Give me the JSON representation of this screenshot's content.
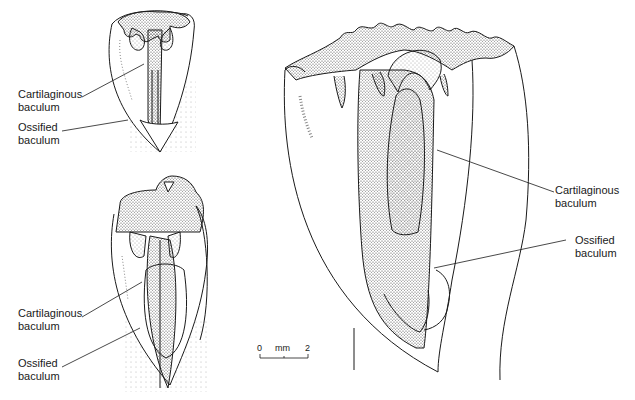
{
  "figure": {
    "panels": [
      {
        "id": "top-left",
        "labels": [
          {
            "line1": "Cartilaginous",
            "line2": "baculum"
          },
          {
            "line1": "Ossified",
            "line2": "baculum"
          }
        ]
      },
      {
        "id": "bottom-left",
        "labels": [
          {
            "line1": "Cartilaginous",
            "line2": "baculum"
          },
          {
            "line1": "Ossified",
            "line2": "baculum"
          }
        ]
      },
      {
        "id": "right",
        "labels": [
          {
            "line1": "Cartilaginous",
            "line2": "baculum"
          },
          {
            "line1": "Ossified",
            "line2": "baculum"
          }
        ]
      }
    ],
    "scale_bar": {
      "start": "0",
      "unit": "mm",
      "end": "2"
    },
    "colors": {
      "ink": "#1a1a1a",
      "stipple": "#555555",
      "background": "#ffffff"
    }
  }
}
